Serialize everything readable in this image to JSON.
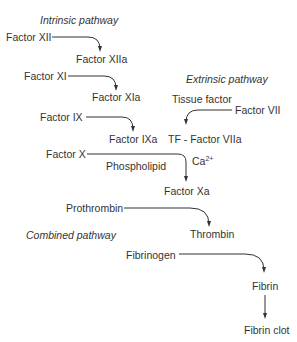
{
  "diagram": {
    "headings": {
      "intrinsic": "Intrinsic pathway",
      "extrinsic": "Extrinsic pathway",
      "combined": "Combined pathway"
    },
    "nodes": {
      "factor_xii": "Factor XII",
      "factor_xiia": "Factor XIIa",
      "factor_xi": "Factor XI",
      "factor_xia": "Factor XIa",
      "factor_ix": "Factor IX",
      "factor_ixa": "Factor IXa",
      "tissue_factor": "Tissue factor",
      "factor_vii": "Factor VII",
      "tf_factor_viia": "TF - Factor VIIa",
      "factor_x": "Factor X",
      "phospholipid": "Phospholipid",
      "ca_base": "Ca",
      "ca_sup": "2+",
      "factor_xa": "Factor Xa",
      "prothrombin": "Prothrombin",
      "thrombin": "Thrombin",
      "fibrinogen": "Fibrinogen",
      "fibrin": "Fibrin",
      "fibrin_clot": "Fibrin clot"
    },
    "edges": [
      {
        "from": "Factor XII",
        "to": "Factor XIIa"
      },
      {
        "from": "Factor XI",
        "to": "Factor XIa"
      },
      {
        "from": "Factor IX",
        "to": "Factor IXa"
      },
      {
        "from": "Factor VII",
        "to": "TF - Factor VIIa"
      },
      {
        "from": "Factor X",
        "to": "Factor Xa"
      },
      {
        "from": "Prothrombin",
        "to": "Thrombin"
      },
      {
        "from": "Fibrinogen",
        "to": "Fibrin"
      },
      {
        "from": "Fibrin",
        "to": "Fibrin clot"
      }
    ],
    "colors": {
      "text": "#333333",
      "line": "#333333",
      "background": "#ffffff"
    }
  }
}
